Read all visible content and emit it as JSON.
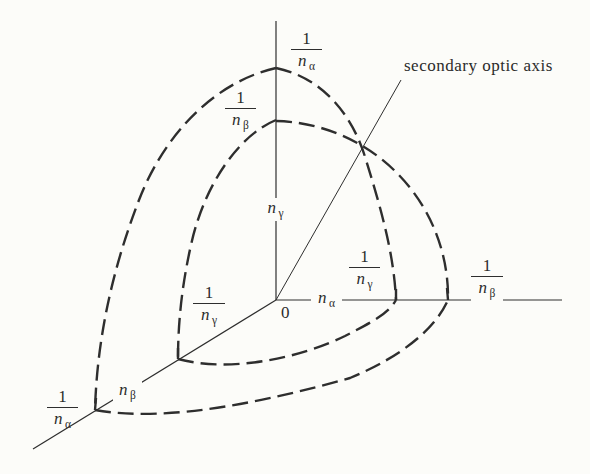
{
  "figure": {
    "annotation": "secondary optic axis",
    "origin_label": "0",
    "axes": {
      "vertical": {
        "base": "n",
        "sub": "γ"
      },
      "horizontal": {
        "base": "n",
        "sub": "α"
      },
      "diagonal": {
        "base": "n",
        "sub": "β"
      }
    },
    "fractions": {
      "top_outer": {
        "num": "1",
        "den_base": "n",
        "den_sub": "α"
      },
      "top_inner": {
        "num": "1",
        "den_base": "n",
        "den_sub": "β"
      },
      "right_inner": {
        "num": "1",
        "den_base": "n",
        "den_sub": "γ"
      },
      "right_outer": {
        "num": "1",
        "den_base": "n",
        "den_sub": "β"
      },
      "diag_inner": {
        "num": "1",
        "den_base": "n",
        "den_sub": "γ"
      },
      "diag_outer": {
        "num": "1",
        "den_base": "n",
        "den_sub": "α"
      }
    },
    "colors": {
      "line": "#2e2e2e",
      "text": "#2b2b2b",
      "background": "#fcfcf9"
    }
  }
}
